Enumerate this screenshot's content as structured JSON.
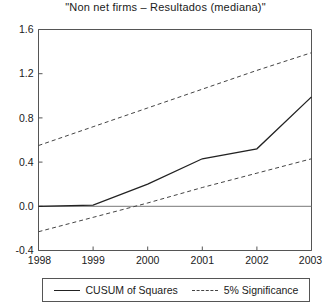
{
  "chart_data": {
    "type": "line",
    "title": "\"Non net firms – Resultados (mediana)\"",
    "xlabel": "",
    "ylabel": "",
    "x": [
      1998,
      1999,
      2000,
      2001,
      2002,
      2003
    ],
    "xlim": [
      1998,
      2003
    ],
    "ylim": [
      -0.4,
      1.6
    ],
    "yticks": [
      -0.4,
      0.0,
      0.4,
      0.8,
      1.2,
      1.6
    ],
    "ytick_labels": [
      "-0.4",
      "0.0",
      "0.4",
      "0.8",
      "1.2",
      "1.6"
    ],
    "xticks": [
      1998,
      1999,
      2000,
      2001,
      2002,
      2003
    ],
    "xtick_labels": [
      "1998",
      "1999",
      "2000",
      "2001",
      "2002",
      "2003"
    ],
    "grid": false,
    "legend_position": "below-axes",
    "zero_line": 0.0,
    "series": [
      {
        "name": "CUSUM of Squares",
        "style": "solid",
        "color": "#222222",
        "values": [
          0.0,
          0.01,
          0.2,
          0.43,
          0.52,
          0.99
        ]
      },
      {
        "name": "5% Significance",
        "style": "dashed",
        "color": "#444444",
        "sublabel": "upper band",
        "values": [
          0.55,
          0.72,
          0.89,
          1.06,
          1.23,
          1.39
        ]
      },
      {
        "name": "5% Significance",
        "style": "dashed",
        "color": "#444444",
        "sublabel": "lower band",
        "values": [
          -0.23,
          -0.1,
          0.03,
          0.17,
          0.3,
          0.43
        ]
      }
    ]
  },
  "legend": {
    "entries": [
      {
        "label": "CUSUM of Squares",
        "style": "solid"
      },
      {
        "label": "5% Significance",
        "style": "dashed"
      }
    ]
  }
}
